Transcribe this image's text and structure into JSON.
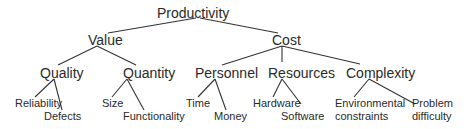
{
  "diagram": {
    "type": "tree",
    "root": "Productivity",
    "nodes": {
      "productivity": "Productivity",
      "value": "Value",
      "cost": "Cost",
      "quality": "Quality",
      "quantity": "Quantity",
      "personnel": "Personnel",
      "resources": "Resources",
      "complexity": "Complexity",
      "reliability": "Reliability",
      "defects": "Defects",
      "size": "Size",
      "functionality": "Functionality",
      "time": "Time",
      "money": "Money",
      "hardware": "Hardware",
      "software": "Software",
      "environmental_1": "Environmental",
      "environmental_2": "constraints",
      "problem_1": "Problem",
      "problem_2": "difficulty"
    },
    "edges": [
      [
        "Productivity",
        "Value"
      ],
      [
        "Productivity",
        "Cost"
      ],
      [
        "Value",
        "Quality"
      ],
      [
        "Value",
        "Quantity"
      ],
      [
        "Cost",
        "Personnel"
      ],
      [
        "Cost",
        "Resources"
      ],
      [
        "Cost",
        "Complexity"
      ],
      [
        "Quality",
        "Reliability"
      ],
      [
        "Quality",
        "Defects"
      ],
      [
        "Quantity",
        "Size"
      ],
      [
        "Quantity",
        "Functionality"
      ],
      [
        "Personnel",
        "Time"
      ],
      [
        "Personnel",
        "Money"
      ],
      [
        "Resources",
        "Hardware"
      ],
      [
        "Resources",
        "Software"
      ],
      [
        "Complexity",
        "Environmental constraints"
      ],
      [
        "Complexity",
        "Problem difficulty"
      ]
    ],
    "colors": {
      "line": "#333333",
      "text": "#2a2a2a",
      "background": "#ffffff"
    }
  }
}
